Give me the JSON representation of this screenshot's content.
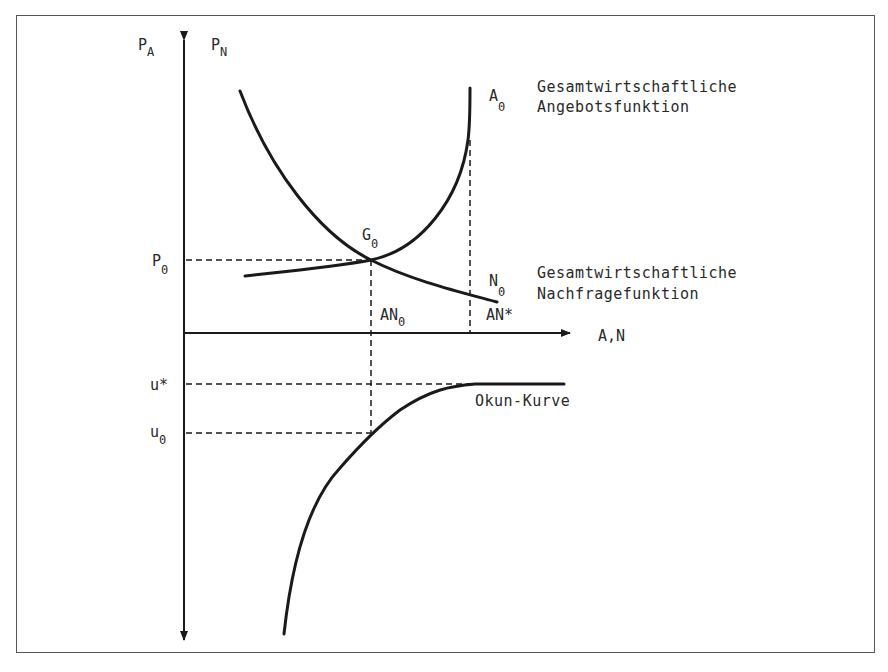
{
  "axes": {
    "y_label_left_main": "P",
    "y_label_left_sub": "A",
    "y_label_right_main": "P",
    "y_label_right_sub": "N",
    "x_label": "A,N",
    "p0_main": "P",
    "p0_sub": "0",
    "u_star": "u*",
    "u0_main": "u",
    "u0_sub": "0"
  },
  "curves": {
    "supply": {
      "name_main": "A",
      "name_sub": "0",
      "desc_line1": "Gesamtwirtschaftliche",
      "desc_line2": "Angebotsfunktion"
    },
    "demand": {
      "name_main": "N",
      "name_sub": "0",
      "desc_line1": "Gesamtwirtschaftliche",
      "desc_line2": "Nachfragefunktion"
    },
    "okun": {
      "name": "Okun-Kurve"
    }
  },
  "points": {
    "equilibrium_main": "G",
    "equilibrium_sub": "0",
    "an0_main": "AN",
    "an0_sub": "0",
    "an_star": "AN*"
  },
  "colors": {
    "line": "#1a1a1a",
    "frame": "#555555",
    "text": "#2a2a2a"
  }
}
